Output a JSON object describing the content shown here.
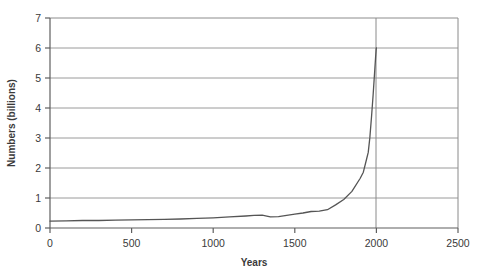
{
  "chart_data": {
    "type": "line",
    "title": "",
    "subtitle": "",
    "xlabel": "Years",
    "ylabel": "Numbers (billions)",
    "xlim": [
      0,
      2500
    ],
    "ylim": [
      0,
      7
    ],
    "xticks": [
      "0",
      "500",
      "1000",
      "1500",
      "2000",
      "2500"
    ],
    "xtick_values": [
      0,
      500,
      1000,
      1500,
      2000,
      2500
    ],
    "yticks": [
      "0",
      "1",
      "2",
      "3",
      "4",
      "5",
      "6",
      "7"
    ],
    "ytick_values": [
      0,
      1,
      2,
      3,
      4,
      5,
      6,
      7
    ],
    "grid": "horizontal-and-vertical-at-2000",
    "legend": "none",
    "line_color": "#555555",
    "grid_color": "#9a9a9a",
    "axis_color": "#6b6b6b",
    "background": "#ffffff",
    "series": [
      {
        "name": "World population",
        "x": [
          0,
          100,
          200,
          300,
          400,
          500,
          600,
          700,
          800,
          900,
          1000,
          1100,
          1200,
          1250,
          1300,
          1350,
          1400,
          1450,
          1500,
          1550,
          1600,
          1650,
          1700,
          1750,
          1800,
          1850,
          1900,
          1920,
          1940,
          1950,
          1960,
          1970,
          1980,
          1990,
          1995,
          1999,
          2000
        ],
        "values": [
          0.23,
          0.24,
          0.25,
          0.25,
          0.26,
          0.27,
          0.28,
          0.29,
          0.3,
          0.32,
          0.34,
          0.37,
          0.4,
          0.42,
          0.43,
          0.37,
          0.38,
          0.42,
          0.46,
          0.5,
          0.55,
          0.56,
          0.61,
          0.77,
          0.95,
          1.22,
          1.65,
          1.86,
          2.3,
          2.52,
          3.02,
          3.7,
          4.44,
          5.27,
          5.68,
          5.98,
          6.0
        ]
      }
    ],
    "annotations": [
      {
        "name": "vertical-reference-line",
        "x": 2000,
        "label": ""
      },
      {
        "name": "asymptote-line-at-6",
        "y": 6,
        "label": ""
      }
    ]
  },
  "axes": {
    "y_axis_title": "Numbers (billions)",
    "x_axis_title": "Years"
  }
}
